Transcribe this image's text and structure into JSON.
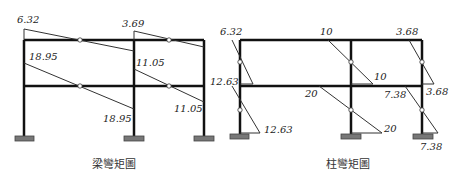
{
  "diagrams": [
    {
      "caption": "梁彎矩圖",
      "labels": {
        "top_left": "6.32",
        "top_mid": "3.69",
        "mid_left": "18.95",
        "mid_mid": "11.05",
        "bot_left": "18.95",
        "bot_right": "11.05"
      }
    },
    {
      "caption": "柱彎矩圖",
      "labels": {
        "top_left": "6.32",
        "top_mid": "10",
        "top_right": "3.68",
        "mid_left": "12.63",
        "mid_mid": "10",
        "mid_right_a": "7.38",
        "mid_right_b": "3.68",
        "beam_mid": "20",
        "bot_left": "12.63",
        "bot_mid": "20",
        "bot_right": "7.38"
      }
    }
  ],
  "colors": {
    "frame": "#111111",
    "support": "#777777",
    "line": "#333333"
  }
}
